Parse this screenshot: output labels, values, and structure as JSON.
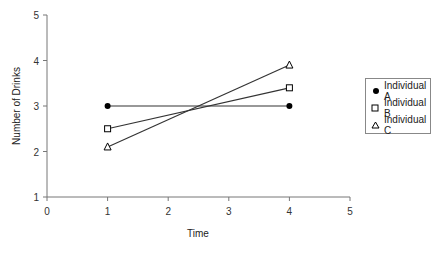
{
  "chart_data": {
    "type": "line",
    "title": "",
    "xlabel": "Time",
    "ylabel": "Number of Drinks",
    "xlim": [
      0,
      5
    ],
    "ylim": [
      1,
      5
    ],
    "xticks": [
      0,
      1,
      2,
      3,
      4,
      5
    ],
    "yticks": [
      1,
      2,
      3,
      4,
      5
    ],
    "grid": false,
    "legend_position": "right",
    "x": [
      1,
      4
    ],
    "series": [
      {
        "name": "Individual A",
        "marker": "circle-filled",
        "values": [
          3.0,
          3.0
        ]
      },
      {
        "name": "Individual B",
        "marker": "square-open",
        "values": [
          2.5,
          3.4
        ]
      },
      {
        "name": "Individual C",
        "marker": "triangle-open",
        "values": [
          2.1,
          3.9
        ]
      }
    ]
  },
  "legend": {
    "items": [
      "Individual A",
      "Individual B",
      "Individual C"
    ]
  },
  "axes": {
    "x_title": "Time",
    "y_title": "Number of Drinks"
  }
}
